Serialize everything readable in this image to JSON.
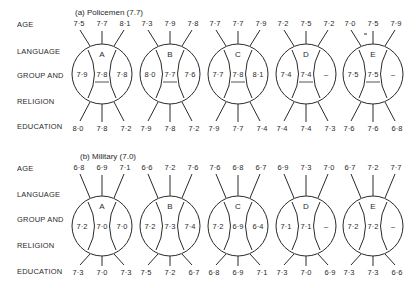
{
  "row_labels": [
    "AGE",
    "LANGUAGE",
    "GROUP AND",
    "RELIGION",
    "EDUCATION"
  ],
  "panels": [
    {
      "title": "(a) Policemen (7.7)",
      "underline_middle": true,
      "groups": [
        {
          "label": "A",
          "age": [
            "7·5",
            "7·7",
            "8·1"
          ],
          "language": [
            "7·9",
            "7·8",
            "7·8"
          ],
          "education": [
            "8·0",
            "7·8",
            "7·2"
          ]
        },
        {
          "label": "B",
          "age": [
            "7·3",
            "7·9",
            "7·8"
          ],
          "language": [
            "8·0",
            "7·7",
            "7·6"
          ],
          "education": [
            "7·9",
            "7·8",
            "7·2"
          ]
        },
        {
          "label": "C",
          "age": [
            "7·7",
            "7·7",
            "7·9"
          ],
          "language": [
            "7·7",
            "7·8",
            "8·1"
          ],
          "education": [
            "7·9",
            "7·7",
            "7·4"
          ]
        },
        {
          "label": "D",
          "age": [
            "7·2",
            "7·5",
            "7·2"
          ],
          "language": [
            "7·4",
            "7·4",
            "–"
          ],
          "education": [
            "7·4",
            "7·4",
            "7·3"
          ]
        },
        {
          "label": "E",
          "age": [
            "7·0",
            "7·5",
            "7·9"
          ],
          "language": [
            "7·5",
            "7·5",
            "–"
          ],
          "education": [
            "7·6",
            "7·6",
            "6·8"
          ]
        }
      ]
    },
    {
      "title": "(b) Military (7.0)",
      "underline_middle": false,
      "groups": [
        {
          "label": "A",
          "age": [
            "6·8",
            "6·9",
            "7·1"
          ],
          "language": [
            "7·2",
            "7·0",
            "7·0"
          ],
          "education": [
            "7·3",
            "7·0",
            "7·3"
          ]
        },
        {
          "label": "B",
          "age": [
            "6·6",
            "7·2",
            "7·6"
          ],
          "language": [
            "7·2",
            "7·3",
            "7·4"
          ],
          "education": [
            "7·5",
            "7·2",
            "6·7"
          ]
        },
        {
          "label": "C",
          "age": [
            "7·6",
            "6·8",
            "6·7"
          ],
          "language": [
            "7·2",
            "6·9",
            "6·4"
          ],
          "education": [
            "6·8",
            "6·9",
            "7·1"
          ]
        },
        {
          "label": "D",
          "age": [
            "6·9",
            "7·3",
            "7·0"
          ],
          "language": [
            "7·1",
            "7·1",
            "–"
          ],
          "education": [
            "7·3",
            "7·0",
            "6·9"
          ]
        },
        {
          "label": "E",
          "age": [
            "6·7",
            "7·2",
            "7·7"
          ],
          "language": [
            "7·2",
            "7·2",
            "–"
          ],
          "education": [
            "7·3",
            "7·3",
            "6·6"
          ]
        }
      ]
    }
  ]
}
